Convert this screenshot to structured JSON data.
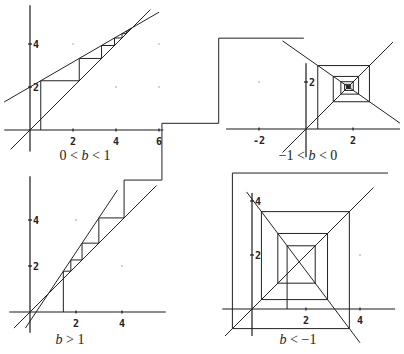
{
  "figure": {
    "panels": [
      {
        "id": "tl",
        "caption": "0 < b < 1",
        "caption_pos": [
          85,
          162
        ],
        "origin_px": [
          30,
          130
        ],
        "unit_px": 21.5,
        "a": 2.0,
        "b": 0.58,
        "x0": 0.5,
        "steps": 9,
        "x_range": [
          -1.2,
          6.2
        ],
        "y_range": [
          -1.0,
          5.8
        ],
        "diag_range": [
          -0.9,
          5.6
        ],
        "map_range": [
          -1.2,
          6.0
        ],
        "x_ticks": [
          {
            "v": 2,
            "label": "2"
          },
          {
            "v": 4,
            "label": "4"
          },
          {
            "v": 6,
            "label": "6"
          }
        ],
        "y_ticks": [
          {
            "v": 2,
            "label": "2"
          },
          {
            "v": 4,
            "label": "4"
          }
        ],
        "grid_dots": [
          [
            2,
            4
          ],
          [
            4,
            2
          ],
          [
            6,
            2
          ],
          [
            6,
            4
          ]
        ]
      },
      {
        "id": "tr",
        "caption": "−1 < b < 0",
        "caption_pos": [
          308,
          162
        ],
        "origin_px": [
          306,
          129
        ],
        "unit_px": 23.5,
        "a": 3.05,
        "b": -0.7,
        "x0": 0.5,
        "steps": 14,
        "x_range": [
          -3.4,
          4.0
        ],
        "y_range": [
          -1.2,
          2.8
        ],
        "diag_range": [
          -1.0,
          3.7
        ],
        "map_range": [
          -1.0,
          4.0
        ],
        "x_ticks": [
          {
            "v": -2,
            "label": "-2"
          },
          {
            "v": 2,
            "label": "2"
          }
        ],
        "y_ticks": [
          {
            "v": 2,
            "label": "2"
          }
        ],
        "grid_dots": [
          [
            -2,
            2
          ]
        ]
      },
      {
        "id": "bl",
        "caption": "b > 1",
        "caption_pos": [
          70,
          346
        ],
        "origin_px": [
          30,
          312
        ],
        "unit_px": 23,
        "a": -0.4,
        "b": 1.5,
        "x0": 1.45,
        "steps": 7,
        "x_range": [
          -0.9,
          5.9
        ],
        "y_range": [
          -0.9,
          5.9
        ],
        "diag_range": [
          -0.7,
          5.5
        ],
        "map_range": [
          -0.2,
          3.8
        ],
        "x_ticks": [
          {
            "v": 2,
            "label": "2"
          },
          {
            "v": 4,
            "label": "4"
          }
        ],
        "y_ticks": [
          {
            "v": 2,
            "label": "2"
          },
          {
            "v": 4,
            "label": "4"
          }
        ],
        "grid_dots": [
          [
            2,
            4
          ],
          [
            4,
            2
          ]
        ]
      },
      {
        "id": "br",
        "caption": "b < −1",
        "caption_pos": [
          298,
          346
        ],
        "origin_px": [
          252,
          309
        ],
        "unit_px": 27,
        "a": 4.07,
        "b": -1.33,
        "x0": 1.3,
        "steps": 7,
        "x_range": [
          -1.1,
          5.3
        ],
        "y_range": [
          -1.0,
          4.3
        ],
        "diag_range": [
          -1.0,
          4.5
        ],
        "map_range": [
          -0.2,
          4.0
        ],
        "x_ticks": [
          {
            "v": 2,
            "label": "2"
          },
          {
            "v": 4,
            "label": "4"
          }
        ],
        "y_ticks": [
          {
            "v": 2,
            "label": "2"
          },
          {
            "v": 4,
            "label": "4"
          }
        ],
        "grid_dots": [
          [
            4,
            2
          ]
        ]
      }
    ]
  }
}
